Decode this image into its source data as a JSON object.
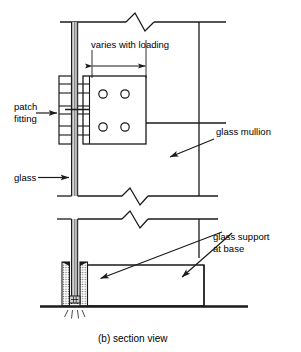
{
  "figure": {
    "caption": "(b) section view",
    "title_part": "(b)",
    "view_name": "section view",
    "domain": "technical-drawing"
  },
  "labels": {
    "varies_with_loading": "varies with loading",
    "patch_fitting_line1": "patch",
    "patch_fitting_line2": "fitting",
    "glass": "glass",
    "glass_mullion": "glass mullion",
    "glass_support_line1": "glass support",
    "glass_support_line2": "at base"
  },
  "colors": {
    "line": "#1a1a1a",
    "glass_fill": "#b9b9b9",
    "hatch": "#6e6e6e",
    "background": "#ffffff",
    "text": "#000000"
  },
  "components": {
    "patch_fitting": {
      "name": "patch fitting",
      "bolt_holes": 4,
      "bolt_hole_rows": 2,
      "bolt_hole_cols": 2
    },
    "glass_mullion": {
      "name": "glass mullion"
    },
    "glass_pane": {
      "name": "glass"
    },
    "glass_support_at_base": {
      "name": "glass support at base"
    },
    "break_symbols": 3,
    "dimension_lines": 1
  },
  "annotations": [
    {
      "id": "varies-with-loading",
      "text": "varies with loading",
      "type": "dimension"
    },
    {
      "id": "patch-fitting",
      "text": "patch fitting",
      "type": "leader-arrow"
    },
    {
      "id": "glass",
      "text": "glass",
      "type": "leader-arrow"
    },
    {
      "id": "glass-mullion",
      "text": "glass mullion",
      "type": "leader-arrow"
    },
    {
      "id": "glass-support-at-base",
      "text": "glass support at base",
      "type": "leader-arrow"
    }
  ]
}
